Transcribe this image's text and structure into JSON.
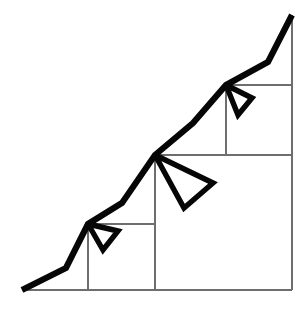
{
  "figure": {
    "width": 307,
    "height": 310,
    "background_color": "#ffffff",
    "stroke_color": "#060606",
    "grid_color": "#6e6e6e",
    "thick_stroke_width": 6.2,
    "grid_stroke_width": 1.4
  },
  "chart_data": {
    "type": "line",
    "xlabel": "",
    "ylabel": "",
    "grid": true,
    "legend": null,
    "xlim": [
      0,
      307
    ],
    "ylim": [
      0,
      310
    ],
    "series": [
      {
        "name": "staircase-polyline",
        "points": [
          [
            22,
            290
          ],
          [
            66,
            268
          ],
          [
            88,
            224
          ],
          [
            122,
            203
          ],
          [
            155,
            155
          ],
          [
            193,
            123
          ],
          [
            226,
            85
          ],
          [
            268,
            62
          ],
          [
            292,
            15
          ]
        ]
      },
      {
        "name": "fan-wedge-small",
        "points": [
          [
            88,
            224
          ],
          [
            118,
            231
          ],
          [
            103,
            250
          ],
          [
            88,
            224
          ]
        ]
      },
      {
        "name": "fan-wedge-medium",
        "points": [
          [
            155,
            155
          ],
          [
            213,
            183
          ],
          [
            184,
            208
          ],
          [
            155,
            155
          ]
        ]
      },
      {
        "name": "fan-wedge-upper",
        "points": [
          [
            226,
            85
          ],
          [
            252,
            98
          ],
          [
            238,
            115
          ],
          [
            226,
            85
          ]
        ]
      }
    ]
  },
  "grid": {
    "baseline": {
      "label": "baseline",
      "x1": 22,
      "y1": 290,
      "x2": 292,
      "y2": 290
    },
    "right_edge": {
      "label": "right-edge",
      "x1": 292,
      "y1": 15,
      "x2": 292,
      "y2": 290
    },
    "squares": [
      {
        "name": "square-small",
        "corner": [
          88,
          224
        ],
        "size_x": 67,
        "size_y": 66,
        "vertical": {
          "x1": 88,
          "y1": 224,
          "x2": 88,
          "y2": 290
        },
        "horizontal": {
          "x1": 88,
          "y1": 224,
          "x2": 155,
          "y2": 224
        }
      },
      {
        "name": "square-medium",
        "corner": [
          155,
          155
        ],
        "size_x": 137,
        "size_y": 135,
        "vertical": {
          "x1": 155,
          "y1": 155,
          "x2": 155,
          "y2": 290
        },
        "horizontal": {
          "x1": 155,
          "y1": 155,
          "x2": 292,
          "y2": 155
        }
      },
      {
        "name": "square-upper",
        "corner": [
          226,
          85
        ],
        "size_x": 66,
        "size_y": 70,
        "vertical": {
          "x1": 226,
          "y1": 85,
          "x2": 226,
          "y2": 155
        },
        "horizontal": {
          "x1": 226,
          "y1": 85,
          "x2": 292,
          "y2": 85
        }
      }
    ]
  },
  "nodes": [
    {
      "name": "origin-node",
      "x": 22,
      "y": 290
    },
    {
      "name": "fan-node-small",
      "x": 88,
      "y": 224
    },
    {
      "name": "fan-node-medium",
      "x": 155,
      "y": 155
    },
    {
      "name": "fan-node-upper",
      "x": 226,
      "y": 85
    },
    {
      "name": "apex-node",
      "x": 292,
      "y": 15
    }
  ]
}
